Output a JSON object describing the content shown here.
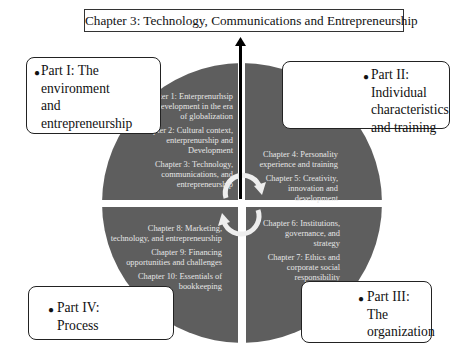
{
  "title": "Chapter 3: Technology, Communications and Entrepreneurship",
  "colors": {
    "pie_fill": "#5e5e5e",
    "pie_text": "#e6e6e6",
    "gap": "#ffffff",
    "arrow": "#000000",
    "cycle_arrow": "#eeeeee"
  },
  "parts": {
    "part1": {
      "lines": [
        "Part I: The",
        "environment",
        "and",
        "entrepreneurship"
      ]
    },
    "part2": {
      "lines": [
        "Part II:",
        "Individual",
        "characteristics",
        "and training"
      ]
    },
    "part3": {
      "lines": [
        "Part III:",
        "The",
        "organization"
      ]
    },
    "part4": {
      "lines": [
        "Part IV:",
        "Process"
      ]
    }
  },
  "quadrants": {
    "top_left": {
      "chapters": [
        "Chapter 1: Enterprenurhsip and development in the era of globalization",
        "Chapter 2: Cultural context, enterprenurship and Development",
        "Chapter 3: Technology, communications, and entrepreneurship"
      ]
    },
    "top_right": {
      "chapters": [
        "Chapter 4: Personality experience and training",
        "Chapter 5: Creativity, innovation and development"
      ]
    },
    "bottom_right": {
      "chapters": [
        "Chapter 6: Institutions, governance, and strategy",
        "Chapter 7: Ethics and corporate social responsibility"
      ]
    },
    "bottom_left": {
      "chapters": [
        "Chapter 8: Marketing, technology, and entrepreneurship",
        "Chapter 9: Financing opportunities and challenges",
        "Chapter 10: Essentials of bookkeeping"
      ]
    }
  },
  "icons": {
    "center_arrow": "up-arrow-icon",
    "cycle": "cycle-arrows-icon"
  }
}
